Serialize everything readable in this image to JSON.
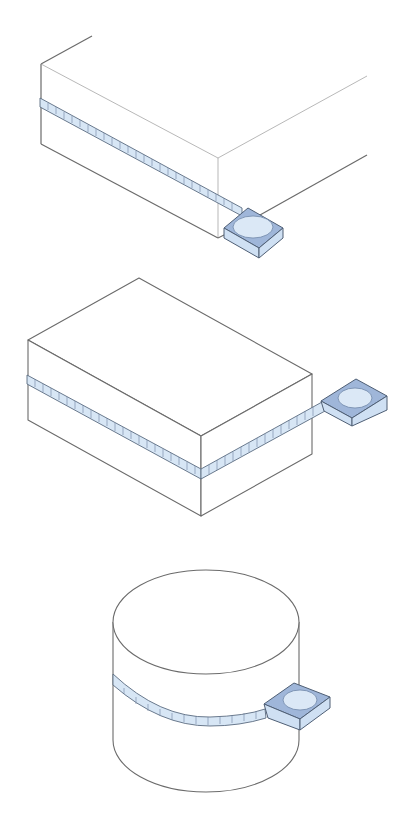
{
  "figure": {
    "colors": {
      "outline": "#6b6b6b",
      "tape_fill": "#d7e6f5",
      "tape_stroke": "#5a6b80",
      "case_top": "#9fb6d9",
      "case_side": "#cfe0f3",
      "background": "#ffffff"
    },
    "panels": [
      {
        "id": "panel-1",
        "subject": "large flat box (partial view) with tape measure along side"
      },
      {
        "id": "panel-2",
        "subject": "rectangular box with tape measure wrapped around middle"
      },
      {
        "id": "panel-3",
        "subject": "cylinder with tape measure wrapped around circumference"
      }
    ]
  }
}
